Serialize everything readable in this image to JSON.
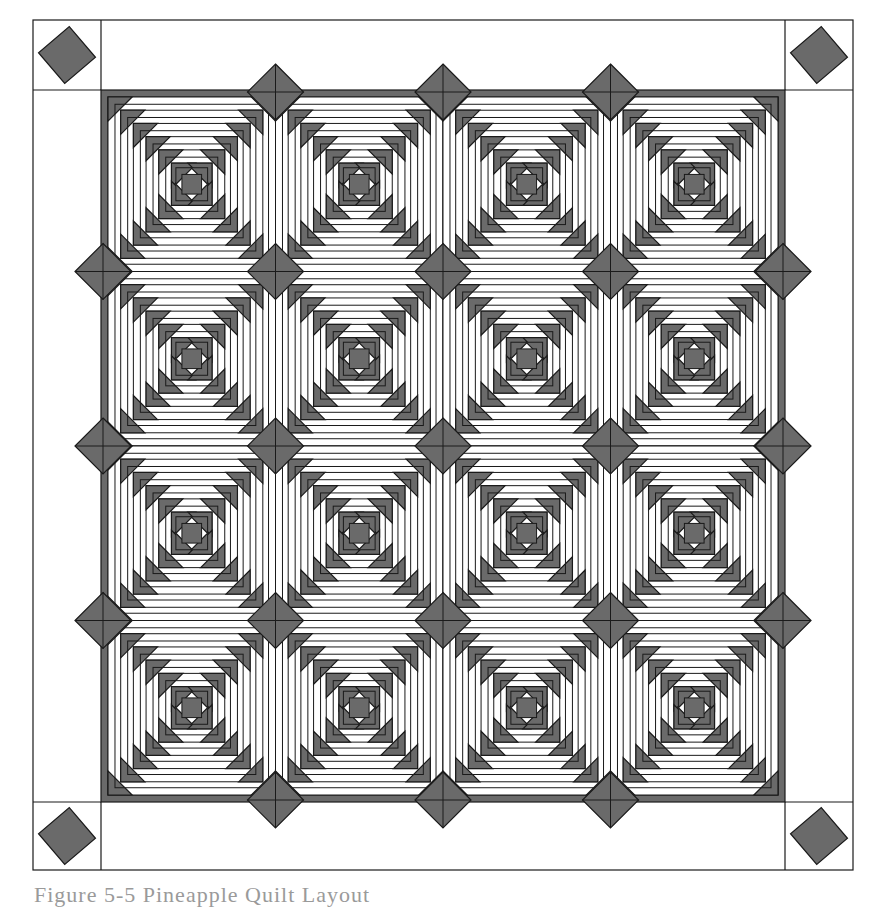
{
  "figure": {
    "caption": "Figure 5-5 Pineapple Quilt Layout",
    "colors": {
      "dark": "#6a6a6a",
      "light": "#ffffff",
      "line": "#1a1a1a",
      "caption": "#9a9a9a"
    }
  },
  "quilt": {
    "outer_frame": {
      "x": 33,
      "y": 20,
      "w": 820,
      "h": 850
    },
    "corner_square_size": 68,
    "inner_field": {
      "x": 101,
      "y": 90,
      "w": 684,
      "h": 712
    },
    "blocks": {
      "rows": 4,
      "cols": 4,
      "pattern": "pineapple"
    },
    "corner_blocks": [
      "top-left",
      "top-right",
      "bottom-left",
      "bottom-right"
    ]
  }
}
